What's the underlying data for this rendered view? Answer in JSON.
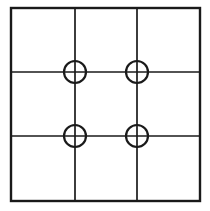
{
  "diagram": {
    "type": "grid-with-nodes",
    "background_color": "#ffffff",
    "stroke_color": "#1a1a1a",
    "canvas": {
      "width": 210,
      "height": 211
    },
    "outer_border": {
      "name": "outer-square-border",
      "x": 11,
      "y": 8,
      "width": 189,
      "height": 193,
      "stroke_width": 2.4
    },
    "interior_lines": {
      "vertical": [
        {
          "name": "vertical-line-1",
          "x": 75,
          "y1": 8,
          "y2": 201,
          "stroke_width": 1.7
        },
        {
          "name": "vertical-line-2",
          "x": 137,
          "y1": 8,
          "y2": 201,
          "stroke_width": 1.7
        }
      ],
      "horizontal": [
        {
          "name": "horizontal-line-1",
          "y": 72,
          "x1": 11,
          "x2": 200,
          "stroke_width": 1.7
        },
        {
          "name": "horizontal-line-2",
          "y": 136,
          "x1": 11,
          "x2": 200,
          "stroke_width": 1.7
        }
      ]
    },
    "nodes": [
      {
        "name": "node-top-left",
        "cx": 75,
        "cy": 72,
        "r": 11,
        "stroke_width": 2.2,
        "row": 1,
        "col": 1
      },
      {
        "name": "node-top-right",
        "cx": 137,
        "cy": 72,
        "r": 11,
        "stroke_width": 2.2,
        "row": 1,
        "col": 2
      },
      {
        "name": "node-bottom-left",
        "cx": 75,
        "cy": 136,
        "r": 11,
        "stroke_width": 2.2,
        "row": 2,
        "col": 1
      },
      {
        "name": "node-bottom-right",
        "cx": 137,
        "cy": 136,
        "r": 11,
        "stroke_width": 2.2,
        "row": 2,
        "col": 2
      }
    ],
    "counts": {
      "rows": 3,
      "columns": 3,
      "cells": 9,
      "nodes": 4
    }
  }
}
